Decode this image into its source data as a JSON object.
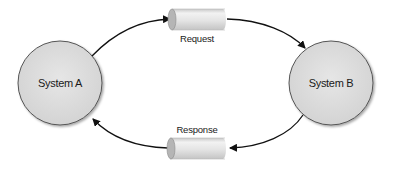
{
  "diagram": {
    "type": "request-response",
    "nodes": [
      {
        "id": "system-a",
        "label": "System A"
      },
      {
        "id": "system-b",
        "label": "System B"
      }
    ],
    "channels": [
      {
        "id": "request",
        "label": "Request",
        "from": "System A",
        "to": "System B"
      },
      {
        "id": "response",
        "label": "Response",
        "from": "System B",
        "to": "System A"
      }
    ],
    "colors": {
      "node_fill": "#dcdcdc",
      "node_stroke": "#555555",
      "pipe_fill": "#e2e2e2",
      "arrow": "#111111"
    }
  }
}
